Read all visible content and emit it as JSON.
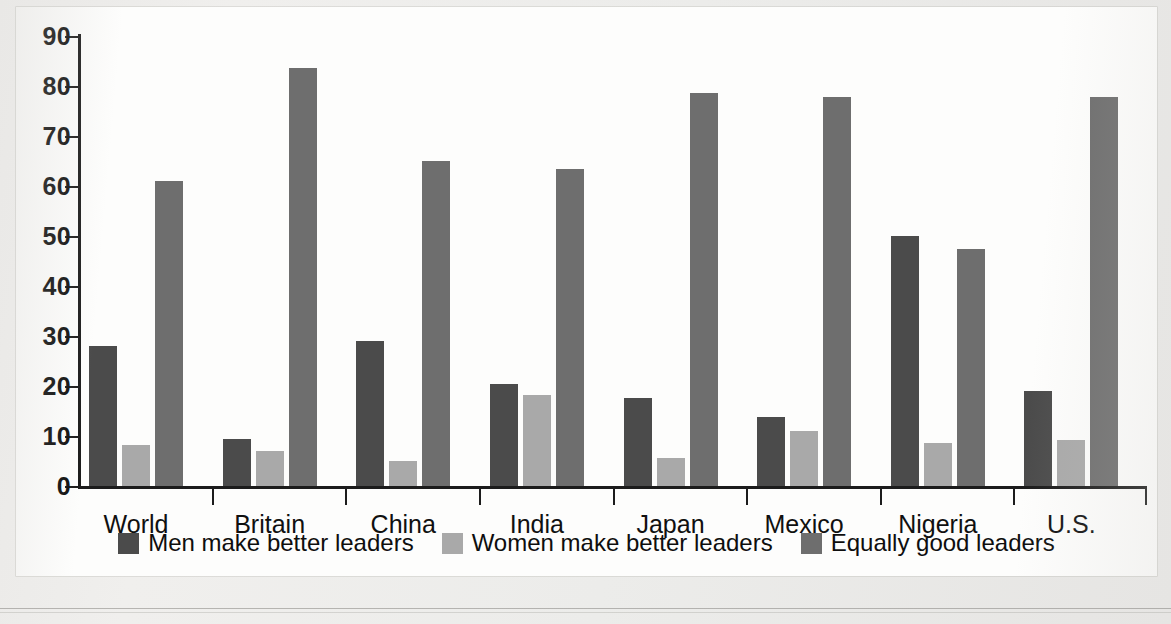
{
  "chart_data": {
    "type": "bar",
    "title": "",
    "subtitle": "",
    "xlabel": "",
    "ylabel": "",
    "ylim": [
      0,
      90
    ],
    "yticks": [
      0,
      10,
      20,
      30,
      40,
      50,
      60,
      70,
      80,
      90
    ],
    "grid": false,
    "legend_position": "bottom",
    "categories": [
      "World",
      "Britain",
      "China",
      "India",
      "Japan",
      "Mexico",
      "Nigeria",
      "U.S."
    ],
    "series": [
      {
        "name": "Men make better leaders",
        "color": "#4b4b4b",
        "values": [
          28,
          9.5,
          29,
          20.4,
          17.6,
          13.9,
          50,
          19
        ]
      },
      {
        "name": "Women make better leaders",
        "color": "#a9a9a9",
        "values": [
          8.3,
          7,
          5,
          18.2,
          5.7,
          11,
          8.7,
          9.2
        ]
      },
      {
        "name": "Equally good leaders",
        "color": "#6e6e6e",
        "values": [
          61,
          83.7,
          65,
          63.4,
          78.6,
          77.8,
          47.4,
          77.8
        ]
      }
    ]
  },
  "axis": {
    "y_tick_labels": [
      "90",
      "80",
      "70",
      "60",
      "50",
      "40",
      "30",
      "20",
      "10",
      "0"
    ]
  },
  "legend": {
    "items": [
      {
        "label": "Men make better leaders",
        "swatch": "men"
      },
      {
        "label": "Women make better leaders",
        "swatch": "women"
      },
      {
        "label": "Equally good leaders",
        "swatch": "equal"
      }
    ]
  },
  "colors": {
    "men": "#4b4b4b",
    "women": "#a9a9a9",
    "equal": "#6e6e6e",
    "axis": "#1c1c1c",
    "panel": "#fdfdfc"
  }
}
